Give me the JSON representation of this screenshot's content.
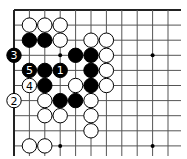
{
  "board": {
    "width": 187,
    "height": 159,
    "origin_x": 14,
    "origin_y": 10,
    "spacing_x": 15.4,
    "spacing_y": 15.1,
    "cols": 11,
    "rows": 10,
    "line_right_extent": 181,
    "line_bottom_extent": 156,
    "edges": [
      "top",
      "left"
    ],
    "colors": {
      "black": "#000000",
      "white": "#ffffff",
      "line": "#555555"
    }
  },
  "star_points": [
    {
      "col": 3,
      "row": 3
    },
    {
      "col": 9,
      "row": 3
    },
    {
      "col": 3,
      "row": 9
    },
    {
      "col": 9,
      "row": 9
    }
  ],
  "stones": [
    {
      "col": 1,
      "row": 1,
      "color": "white"
    },
    {
      "col": 2,
      "row": 1,
      "color": "white"
    },
    {
      "col": 3,
      "row": 1,
      "color": "white"
    },
    {
      "col": 1,
      "row": 2,
      "color": "black"
    },
    {
      "col": 2,
      "row": 2,
      "color": "black"
    },
    {
      "col": 3,
      "row": 2,
      "color": "white"
    },
    {
      "col": 5,
      "row": 2,
      "color": "white"
    },
    {
      "col": 6,
      "row": 2,
      "color": "white"
    },
    {
      "col": 0,
      "row": 3,
      "color": "black",
      "label": "3"
    },
    {
      "col": 4,
      "row": 3,
      "color": "black"
    },
    {
      "col": 5,
      "row": 3,
      "color": "black"
    },
    {
      "col": 6,
      "row": 3,
      "color": "white"
    },
    {
      "col": 1,
      "row": 4,
      "color": "black",
      "label": "5"
    },
    {
      "col": 2,
      "row": 4,
      "color": "black"
    },
    {
      "col": 3,
      "row": 4,
      "color": "black",
      "label": "1"
    },
    {
      "col": 5,
      "row": 4,
      "color": "black"
    },
    {
      "col": 6,
      "row": 4,
      "color": "white"
    },
    {
      "col": 1,
      "row": 5,
      "color": "white",
      "label": "4"
    },
    {
      "col": 2,
      "row": 5,
      "color": "black"
    },
    {
      "col": 4,
      "row": 5,
      "color": "white"
    },
    {
      "col": 5,
      "row": 5,
      "color": "black"
    },
    {
      "col": 6,
      "row": 5,
      "color": "white"
    },
    {
      "col": 0,
      "row": 6,
      "color": "white",
      "label": "2"
    },
    {
      "col": 2,
      "row": 6,
      "color": "white"
    },
    {
      "col": 3,
      "row": 6,
      "color": "black"
    },
    {
      "col": 4,
      "row": 6,
      "color": "black"
    },
    {
      "col": 5,
      "row": 6,
      "color": "white"
    },
    {
      "col": 2,
      "row": 7,
      "color": "white"
    },
    {
      "col": 3,
      "row": 7,
      "color": "white"
    },
    {
      "col": 5,
      "row": 7,
      "color": "white"
    },
    {
      "col": 5,
      "row": 8,
      "color": "white"
    },
    {
      "col": 1,
      "row": 9,
      "color": "white"
    },
    {
      "col": 2,
      "row": 9,
      "color": "white"
    }
  ]
}
